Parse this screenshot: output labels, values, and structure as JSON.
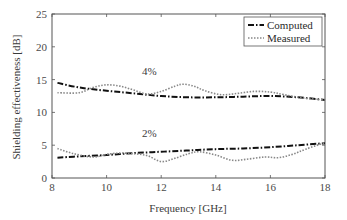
{
  "chart_data": {
    "type": "line",
    "title": "",
    "xlabel": "Frequency [GHz]",
    "ylabel": "Shielding effectiveness [dB]",
    "xlim": [
      8,
      18
    ],
    "ylim": [
      0,
      25
    ],
    "xticks": [
      8,
      10,
      12,
      14,
      16,
      18
    ],
    "yticks": [
      0,
      5,
      10,
      15,
      20,
      25
    ],
    "grid": false,
    "legend": {
      "position": "upper right",
      "entries": [
        "Computed",
        "Measured"
      ]
    },
    "annotations": [
      {
        "text": "4%",
        "x": 11.3,
        "y": 15.7
      },
      {
        "text": "2%",
        "x": 11.3,
        "y": 6.3
      }
    ],
    "series": [
      {
        "name": "Computed",
        "group": "4%",
        "style": "dash-dot",
        "x": [
          8.2,
          9,
          10,
          11,
          12,
          13,
          14,
          15,
          16,
          17,
          18
        ],
        "y": [
          14.5,
          13.8,
          13.3,
          12.9,
          12.5,
          12.3,
          12.3,
          12.4,
          12.5,
          12.3,
          11.9
        ]
      },
      {
        "name": "Measured",
        "group": "4%",
        "style": "dotted",
        "x": [
          8.2,
          9,
          9.5,
          10,
          10.5,
          11,
          11.5,
          12,
          12.5,
          12.8,
          13.2,
          13.6,
          14.2,
          14.8,
          15.4,
          16,
          16.5,
          17.2,
          18
        ],
        "y": [
          13.0,
          13.0,
          13.8,
          14.2,
          14.0,
          13.4,
          12.8,
          13.2,
          14.0,
          14.3,
          14.0,
          13.3,
          12.7,
          12.9,
          13.2,
          13.1,
          12.7,
          12.2,
          11.9
        ]
      },
      {
        "name": "Computed",
        "group": "2%",
        "style": "dash-dot",
        "x": [
          8.2,
          9,
          10,
          11,
          12,
          13,
          14,
          15,
          16,
          17,
          18
        ],
        "y": [
          3.1,
          3.3,
          3.5,
          3.8,
          4.0,
          4.2,
          4.4,
          4.5,
          4.7,
          5.0,
          5.3
        ]
      },
      {
        "name": "Measured",
        "group": "2%",
        "style": "dotted",
        "x": [
          8.2,
          8.8,
          9.5,
          10,
          10.5,
          11,
          11.5,
          12,
          12.5,
          13,
          13.4,
          14,
          14.6,
          15.2,
          15.8,
          16.3,
          16.8,
          17.3,
          18
        ],
        "y": [
          4.5,
          3.7,
          3.2,
          3.6,
          3.8,
          3.7,
          3.4,
          2.5,
          3.0,
          3.7,
          4.0,
          3.5,
          2.7,
          2.9,
          3.2,
          3.1,
          3.6,
          4.4,
          5.4
        ]
      }
    ]
  },
  "labels": {
    "xlabel": "Frequency [GHz]",
    "ylabel": "Shielding effectiveness [dB]",
    "legend_computed": "Computed",
    "legend_measured": "Measured",
    "annot_4": "4%",
    "annot_2": "2%"
  }
}
